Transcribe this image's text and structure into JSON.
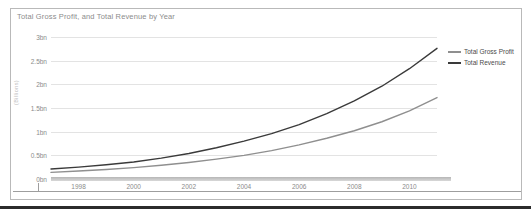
{
  "chart_data": {
    "type": "line",
    "title": "Total Gross Profit, and Total Revenue by Year",
    "xlabel": "",
    "ylabel": "(Billions)",
    "grid": true,
    "legend_position": "right",
    "x": [
      1997,
      1998,
      1999,
      2000,
      2001,
      2002,
      2003,
      2004,
      2005,
      2006,
      2007,
      2008,
      2009,
      2010,
      2011
    ],
    "xtick_labels": [
      "1998",
      "2000",
      "2002",
      "2004",
      "2006",
      "2008",
      "2010"
    ],
    "xticks": [
      1998,
      2000,
      2002,
      2004,
      2006,
      2008,
      2010
    ],
    "xlim": [
      1997,
      2011
    ],
    "ytick_labels": [
      "0bn",
      "0.5bn",
      "1bn",
      "1.5bn",
      "2bn",
      "2.5bn",
      "3bn"
    ],
    "yticks": [
      0,
      0.5,
      1.0,
      1.5,
      2.0,
      2.5,
      3.0
    ],
    "ylim": [
      0,
      3.0
    ],
    "series": [
      {
        "name": "Total Gross Profit",
        "color": "#8f8f8f",
        "values": [
          0.14,
          0.17,
          0.2,
          0.24,
          0.29,
          0.35,
          0.42,
          0.5,
          0.6,
          0.72,
          0.86,
          1.02,
          1.21,
          1.44,
          1.72
        ]
      },
      {
        "name": "Total Revenue",
        "color": "#3a3a3a",
        "values": [
          0.21,
          0.25,
          0.3,
          0.36,
          0.44,
          0.54,
          0.66,
          0.8,
          0.96,
          1.15,
          1.38,
          1.65,
          1.96,
          2.33,
          2.76
        ]
      }
    ]
  }
}
